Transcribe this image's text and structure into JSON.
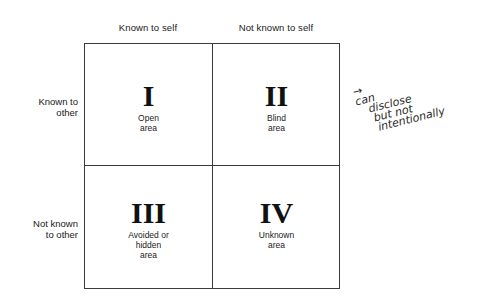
{
  "diagram": {
    "type": "johari-window",
    "columns": [
      {
        "label": "Known to self"
      },
      {
        "label": "Not known to self"
      }
    ],
    "rows": [
      {
        "label_line1": "Known to",
        "label_line2": "other"
      },
      {
        "label_line1": "Not known",
        "label_line2": "to other"
      }
    ],
    "quadrants": [
      {
        "numeral": "I",
        "label_lines": [
          "Open",
          "area"
        ]
      },
      {
        "numeral": "II",
        "label_lines": [
          "Blind",
          "area"
        ]
      },
      {
        "numeral": "III",
        "label_lines": [
          "Avoided or",
          "hidden",
          "area"
        ]
      },
      {
        "numeral": "IV",
        "label_lines": [
          "Unknown",
          "area"
        ]
      }
    ],
    "annotation": {
      "arrow": "→",
      "lines": [
        "can",
        "disclose",
        "but not",
        "intentionally"
      ]
    }
  }
}
